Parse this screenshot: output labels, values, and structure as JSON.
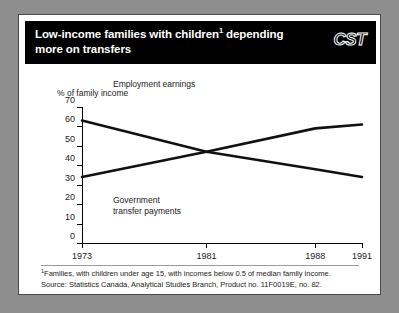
{
  "header": {
    "title_line1": "Low-income families with children",
    "title_marker": "1",
    "title_line1_tail": " depending",
    "title_line2": "more on transfers",
    "logo": "CST"
  },
  "footnotes": {
    "marker": "1",
    "line1": "Families, with children under age 15, with incomes below 0.5 of median family income.",
    "line2": "Source: Statistics Canada, Analytical Studies Branch, Product no. 11F0019E, no. 82."
  },
  "chart_data": {
    "type": "line",
    "xlabel": "",
    "ylabel": "% of family income",
    "x": [
      1973,
      1981,
      1988,
      1991
    ],
    "xtick_labels": [
      "1973",
      "1981",
      "1988",
      "1991"
    ],
    "ytick_labels": [
      "0",
      "10",
      "20",
      "30",
      "40",
      "50",
      "60",
      "70"
    ],
    "yticks": [
      0,
      10,
      20,
      30,
      40,
      50,
      60,
      70
    ],
    "ylim": [
      0,
      70
    ],
    "grid": false,
    "legend_position": "inline-annotations",
    "series": [
      {
        "name": "Employment earnings",
        "values": [
          63,
          47,
          38,
          34
        ],
        "color": "#111111"
      },
      {
        "name": "Government transfer payments",
        "values": [
          34,
          47,
          59,
          61
        ],
        "color": "#111111"
      }
    ],
    "annotations": [
      {
        "text": "Employment earnings",
        "x": 1975,
        "y": 67
      },
      {
        "text": "Government transfer payments",
        "x": 1975,
        "y": 27
      }
    ]
  }
}
